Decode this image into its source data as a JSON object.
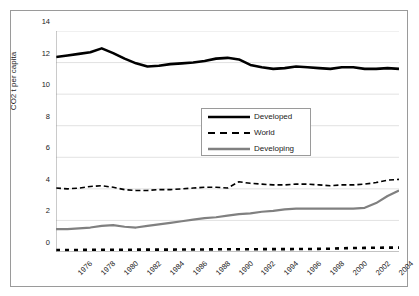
{
  "chart_data": {
    "type": "line",
    "title": "",
    "xlabel": "",
    "ylabel": "CO2 t per capita",
    "xlim": [
      1975,
      2005
    ],
    "ylim": [
      0,
      14
    ],
    "yticks": [
      0,
      2,
      4,
      6,
      8,
      10,
      12,
      14
    ],
    "xticks": [
      1975,
      1976,
      1977,
      1978,
      1979,
      1980,
      1981,
      1982,
      1983,
      1984,
      1985,
      1986,
      1987,
      1988,
      1989,
      1990,
      1991,
      1992,
      1993,
      1994,
      1995,
      1996,
      1997,
      1998,
      1999,
      2000,
      2001,
      2002,
      2003,
      2004,
      2005
    ],
    "xtick_labels": [
      "1976",
      "1978",
      "1980",
      "1982",
      "1984",
      "1986",
      "1988",
      "1990",
      "1992",
      "1994",
      "1996",
      "1998",
      "2000",
      "2002",
      "2004"
    ],
    "xtick_label_years": [
      1976,
      1978,
      1980,
      1982,
      1984,
      1986,
      1988,
      1990,
      1992,
      1994,
      1996,
      1998,
      2000,
      2002,
      2004
    ],
    "grid": "horizontal",
    "legend_position": "upper-center",
    "x": [
      1975,
      1976,
      1977,
      1978,
      1979,
      1980,
      1981,
      1982,
      1983,
      1984,
      1985,
      1986,
      1987,
      1988,
      1989,
      1990,
      1991,
      1992,
      1993,
      1994,
      1995,
      1996,
      1997,
      1998,
      1999,
      2000,
      2001,
      2002,
      2003,
      2004,
      2005
    ],
    "series": [
      {
        "name": "Developed",
        "color": "#000000",
        "style": "solid",
        "width": 2.6,
        "values": [
          12.35,
          12.45,
          12.55,
          12.65,
          12.9,
          12.6,
          12.25,
          11.95,
          11.75,
          11.8,
          11.9,
          11.95,
          12.0,
          12.1,
          12.25,
          12.3,
          12.2,
          11.85,
          11.7,
          11.6,
          11.65,
          11.75,
          11.7,
          11.65,
          11.6,
          11.7,
          11.7,
          11.6,
          11.6,
          11.65,
          11.6
        ]
      },
      {
        "name": "World",
        "color": "#000000",
        "style": "dashed",
        "width": 1.6,
        "values": [
          4.05,
          4.0,
          4.05,
          4.15,
          4.2,
          4.1,
          3.95,
          3.9,
          3.9,
          3.95,
          3.95,
          4.0,
          4.05,
          4.1,
          4.1,
          4.05,
          4.45,
          4.35,
          4.3,
          4.25,
          4.25,
          4.3,
          4.3,
          4.25,
          4.2,
          4.25,
          4.25,
          4.3,
          4.4,
          4.55,
          4.6
        ]
      },
      {
        "name": "Developing",
        "color": "#808080",
        "style": "solid",
        "width": 2.2,
        "values": [
          1.45,
          1.45,
          1.5,
          1.55,
          1.65,
          1.7,
          1.6,
          1.55,
          1.65,
          1.75,
          1.85,
          1.95,
          2.05,
          2.15,
          2.2,
          2.3,
          2.4,
          2.45,
          2.55,
          2.6,
          2.7,
          2.75,
          2.75,
          2.75,
          2.75,
          2.75,
          2.75,
          2.8,
          3.1,
          3.55,
          3.9
        ]
      },
      {
        "name": "",
        "color": "#000000",
        "style": "dashed-thick",
        "width": 2.6,
        "values": [
          0.13,
          0.13,
          0.13,
          0.14,
          0.14,
          0.14,
          0.14,
          0.15,
          0.15,
          0.15,
          0.15,
          0.16,
          0.16,
          0.16,
          0.17,
          0.17,
          0.17,
          0.17,
          0.18,
          0.18,
          0.18,
          0.19,
          0.19,
          0.2,
          0.21,
          0.24,
          0.25,
          0.26,
          0.27,
          0.28,
          0.28
        ]
      }
    ],
    "legend": [
      {
        "label": "Developed",
        "color": "#000000",
        "style": "solid"
      },
      {
        "label": "World",
        "color": "#000000",
        "style": "dashed"
      },
      {
        "label": "Developing",
        "color": "#808080",
        "style": "solid"
      }
    ]
  }
}
